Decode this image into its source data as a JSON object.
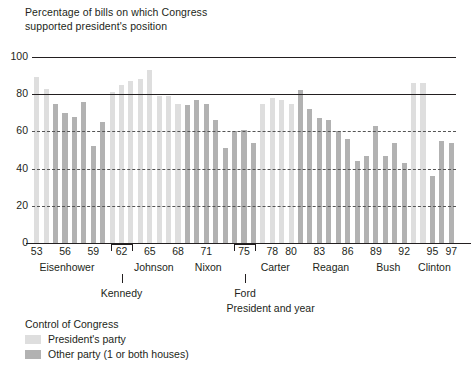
{
  "title": "Percentage of bills on which Congress\nsupported president's position",
  "colors": {
    "presidents_party": "#dedede",
    "other_party": "#b2b2b2",
    "axis": "#231f20"
  },
  "legend": {
    "heading": "Control of Congress",
    "items": [
      {
        "key": "own",
        "label": "President's party"
      },
      {
        "key": "other",
        "label": "Other party (1 or both houses)"
      }
    ]
  },
  "axis": {
    "xlabel": "President and year",
    "yticks": [
      "0",
      "20",
      "40",
      "60",
      "80",
      "100"
    ],
    "xticks": [
      "53",
      "56",
      "59",
      "62",
      "65",
      "68",
      "71",
      "75",
      "78",
      "80",
      "83",
      "86",
      "89",
      "92",
      "95",
      "97"
    ]
  },
  "presidents": [
    {
      "name": "Eisenhower",
      "bracket": false
    },
    {
      "name": "Kennedy",
      "bracket": true
    },
    {
      "name": "Johnson",
      "bracket": false
    },
    {
      "name": "Nixon",
      "bracket": false
    },
    {
      "name": "Ford",
      "bracket": true
    },
    {
      "name": "Carter",
      "bracket": false
    },
    {
      "name": "Reagan",
      "bracket": false
    },
    {
      "name": "Bush",
      "bracket": false
    },
    {
      "name": "Clinton",
      "bracket": false
    }
  ],
  "chart_data": {
    "type": "bar",
    "title": "Percentage of bills on which Congress supported president's position",
    "xlabel": "President and year",
    "ylabel": "",
    "ylim": [
      0,
      100
    ],
    "grid": true,
    "legend_position": "below-plot-left",
    "series_key": "control",
    "categories": [
      "1953",
      "1954",
      "1955",
      "1956",
      "1957",
      "1958",
      "1959",
      "1960",
      "1961",
      "1962",
      "1963",
      "1964",
      "1965",
      "1966",
      "1967",
      "1968",
      "1969",
      "1970",
      "1971",
      "1972",
      "1973",
      "1974",
      "1975",
      "1976",
      "1977",
      "1978",
      "1979",
      "1980",
      "1981",
      "1982",
      "1983",
      "1984",
      "1985",
      "1986",
      "1987",
      "1988",
      "1989",
      "1990",
      "1991",
      "1992",
      "1993",
      "1994",
      "1995",
      "1996",
      "1997"
    ],
    "values": [
      89,
      83,
      75,
      70,
      68,
      76,
      52,
      65,
      81,
      85,
      87,
      88,
      93,
      79,
      79,
      75,
      74,
      77,
      75,
      66,
      51,
      60,
      61,
      54,
      75,
      78,
      77,
      75,
      82,
      72,
      67,
      66,
      60,
      56,
      44,
      47,
      63,
      47,
      54,
      43,
      86,
      86,
      36,
      55,
      54
    ],
    "control": [
      "own",
      "own",
      "other",
      "other",
      "other",
      "other",
      "other",
      "other",
      "own",
      "own",
      "own",
      "own",
      "own",
      "own",
      "own",
      "own",
      "other",
      "other",
      "other",
      "other",
      "other",
      "other",
      "other",
      "other",
      "own",
      "own",
      "own",
      "own",
      "other",
      "other",
      "other",
      "other",
      "other",
      "other",
      "other",
      "other",
      "other",
      "other",
      "other",
      "other",
      "own",
      "own",
      "other",
      "other",
      "other"
    ]
  }
}
